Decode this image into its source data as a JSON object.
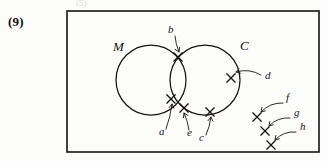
{
  "page": {
    "question_number": "(9)",
    "faint_top_artifact": "(5)",
    "background_color": "#fdfdfb",
    "ink_color": "#17140f"
  },
  "frame": {
    "name": "universal-set-rectangle",
    "x": 67,
    "y": 11,
    "width": 252,
    "height": 141
  },
  "diagram": {
    "type": "venn-diagram",
    "sets": [
      {
        "id": "M",
        "label": "M",
        "cx": 151,
        "cy": 80,
        "r": 35,
        "label_x": 113,
        "label_y": 51
      },
      {
        "id": "C",
        "label": "C",
        "cx": 205,
        "cy": 80,
        "r": 35,
        "label_x": 240,
        "label_y": 50
      }
    ],
    "points": [
      {
        "label": "a",
        "x": 171,
        "y": 99,
        "region": "M-and-C-intersection",
        "label_x": 159,
        "label_y": 135,
        "leader_from_x": 166,
        "leader_from_y": 129,
        "leader_to_x": 172,
        "leader_to_y": 104,
        "arrow_dir": "up"
      },
      {
        "label": "b",
        "x": 178,
        "y": 57,
        "region": "M-and-C-intersection",
        "label_x": 168,
        "label_y": 33,
        "leader_from_x": 175,
        "leader_from_y": 36,
        "leader_to_x": 179,
        "leader_to_y": 52,
        "arrow_dir": "down"
      },
      {
        "label": "c",
        "x": 210,
        "y": 112,
        "region": "C-only",
        "label_x": 199,
        "label_y": 141,
        "leader_from_x": 206,
        "leader_from_y": 135,
        "leader_to_x": 211,
        "leader_to_y": 117,
        "arrow_dir": "up"
      },
      {
        "label": "d",
        "x": 231,
        "y": 78,
        "region": "C-only",
        "label_x": 265,
        "label_y": 79,
        "leader_from_x": 261,
        "leader_from_y": 75,
        "leader_to_x": 236,
        "leader_to_y": 72,
        "arrow_dir": "left"
      },
      {
        "label": "e",
        "x": 184,
        "y": 108,
        "region": "M-and-C-intersection",
        "label_x": 187,
        "label_y": 136,
        "leader_from_x": 189,
        "leader_from_y": 130,
        "leader_to_x": 184,
        "leader_to_y": 113,
        "arrow_dir": "up"
      },
      {
        "label": "f",
        "x": 257,
        "y": 117,
        "region": "outside-both",
        "label_x": 286,
        "label_y": 101,
        "leader_from_x": 283,
        "leader_from_y": 103,
        "leader_to_x": 261,
        "leader_to_y": 112,
        "arrow_dir": "down-left"
      },
      {
        "label": "g",
        "x": 265,
        "y": 131,
        "region": "outside-both",
        "label_x": 294,
        "label_y": 116,
        "leader_from_x": 290,
        "leader_from_y": 118,
        "leader_to_x": 269,
        "leader_to_y": 126,
        "arrow_dir": "down-left"
      },
      {
        "label": "h",
        "x": 271,
        "y": 145,
        "region": "outside-both",
        "label_x": 300,
        "label_y": 130,
        "leader_from_x": 296,
        "leader_from_y": 132,
        "leader_to_x": 275,
        "leader_to_y": 140,
        "arrow_dir": "down-left"
      }
    ]
  }
}
